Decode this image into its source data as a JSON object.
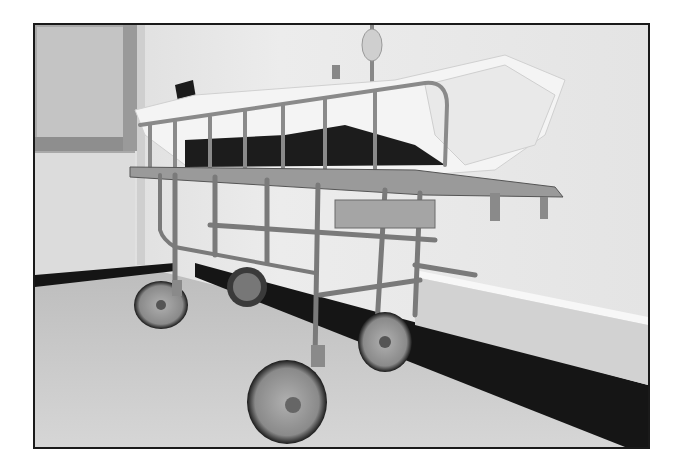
{
  "photo": {
    "description": "Black-and-white photograph of an empty old metal hospital gurney with white sheets and a dark blanket, standing in a corridor against a wall",
    "style": "monochrome",
    "colors": {
      "margin": "#ffffff",
      "frame_border": "#1a1a1a",
      "wall": "#e6e6e6",
      "floor": "#cfcfcf",
      "baseboard": "#151515",
      "metal": "#8c8c8c",
      "sheet": "#f4f4f4",
      "blanket": "#1c1c1c"
    },
    "elements": [
      "window",
      "wall",
      "baseboard",
      "floor",
      "gurney",
      "bed-rail",
      "sheets",
      "blanket",
      "wheels",
      "iv-pole"
    ]
  }
}
